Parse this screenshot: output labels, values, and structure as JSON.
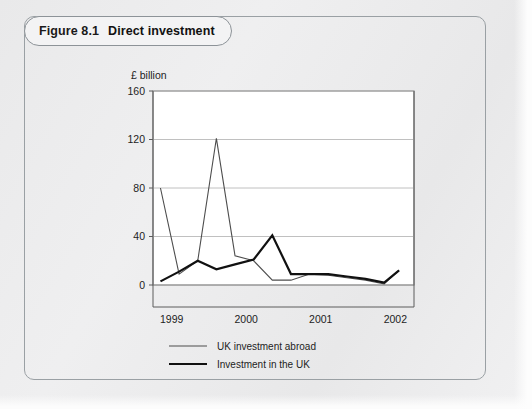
{
  "figure": {
    "number": "Figure 8.1",
    "title": "Direct investment"
  },
  "chart_data": {
    "type": "line",
    "title": "Direct investment",
    "xlabel": "",
    "ylabel": "£ billion",
    "ylim": [
      0,
      160
    ],
    "yticks": [
      0,
      40,
      80,
      120,
      160
    ],
    "ytick_labels": [
      "0",
      "40",
      "80",
      "120",
      "160"
    ],
    "xtick_labels": [
      "1999",
      "2000",
      "2001",
      "2002"
    ],
    "xtick_positions": [
      1999,
      2000,
      2001,
      2002
    ],
    "xlim": [
      1998.75,
      2002.25
    ],
    "grid": true,
    "legend_position": "below",
    "colors": {
      "uk_investment_abroad": "#4d4d4d",
      "investment_in_the_uk": "#111111"
    },
    "series": [
      {
        "name": "UK investment abroad",
        "x": [
          1998.85,
          1999.1,
          1999.35,
          1999.6,
          1999.85,
          2000.1,
          2000.35,
          2000.6,
          2000.85,
          2001.1,
          2001.35,
          2001.6,
          2001.85,
          2002.05
        ],
        "values": [
          80,
          9,
          20,
          121,
          24,
          20,
          4,
          4,
          9,
          8,
          6,
          4,
          1,
          12
        ]
      },
      {
        "name": "Investment in the UK",
        "x": [
          1998.85,
          1999.1,
          1999.35,
          1999.6,
          1999.85,
          2000.1,
          2000.35,
          2000.6,
          2000.85,
          2001.1,
          2001.35,
          2001.6,
          2001.85,
          2002.05
        ],
        "values": [
          3,
          11,
          20,
          13,
          17,
          21,
          41,
          9,
          9,
          9,
          7,
          5,
          2,
          12
        ]
      }
    ],
    "legend": [
      {
        "label": "UK investment abroad",
        "width": 1.1
      },
      {
        "label": "Investment in the UK",
        "width": 2.2
      }
    ]
  }
}
